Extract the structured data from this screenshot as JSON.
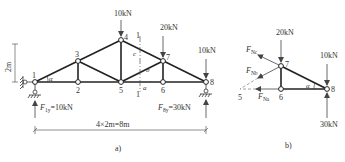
{
  "figure_a": {
    "caption": "a)",
    "height_label": "2m",
    "span_label": "4×2m=8m",
    "angle_label": "α",
    "section_label": "1",
    "member_labels": {
      "a": "a",
      "b": "b",
      "c": "c"
    },
    "nodes": [
      {
        "id": "1",
        "label": "1"
      },
      {
        "id": "2",
        "label": "2"
      },
      {
        "id": "3",
        "label": "3"
      },
      {
        "id": "4",
        "label": "4"
      },
      {
        "id": "5",
        "label": "5"
      },
      {
        "id": "6",
        "label": "6"
      },
      {
        "id": "7",
        "label": "7"
      },
      {
        "id": "8",
        "label": "8"
      }
    ],
    "loads": {
      "node4": "10kN",
      "node7": "20kN",
      "node8": "10kN"
    },
    "reactions": {
      "left": {
        "symbol": "F",
        "sub": "1y",
        "value": "=10kN"
      },
      "right": {
        "symbol": "F",
        "sub": "8y",
        "value": "=30kN"
      }
    }
  },
  "figure_b": {
    "caption": "b)",
    "nodes": [
      {
        "id": "5",
        "label": "5"
      },
      {
        "id": "6",
        "label": "6"
      },
      {
        "id": "7",
        "label": "7"
      },
      {
        "id": "8",
        "label": "8"
      }
    ],
    "angle_label": "α",
    "loads": {
      "node7": "20kN",
      "node8_down": "10kN",
      "node8_up": "30kN"
    },
    "forces": {
      "Nc": {
        "symbol": "F",
        "sub": "Nc"
      },
      "Nb": {
        "symbol": "F",
        "sub": "Nb"
      },
      "Na": {
        "symbol": "F",
        "sub": "Na"
      }
    }
  }
}
